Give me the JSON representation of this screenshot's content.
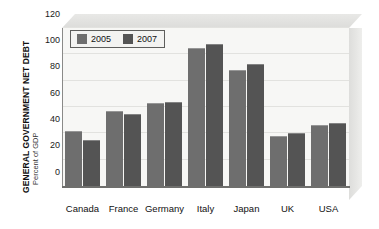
{
  "chart_data": {
    "type": "bar",
    "title": "GENERAL GOVERNMENT NET DEBT",
    "subtitle": "Percent of GDP",
    "xlabel": "",
    "ylabel": "Percent of GDP",
    "categories": [
      "Canada",
      "France",
      "Germany",
      "Italy",
      "Japan",
      "UK",
      "USA"
    ],
    "series": [
      {
        "name": "2005",
        "color": "#6e6e6e",
        "values": [
          42,
          57,
          63,
          105,
          88,
          38,
          46
        ]
      },
      {
        "name": "2007",
        "color": "#545454",
        "values": [
          35,
          55,
          64,
          108,
          93,
          40,
          48
        ]
      }
    ],
    "ylim": [
      0,
      120
    ],
    "yticks": [
      0,
      20,
      40,
      60,
      80,
      100,
      120
    ],
    "ytick_labels": [
      "0",
      "20",
      "40",
      "60",
      "80",
      "100",
      "120"
    ],
    "grid": true,
    "legend_position": "top-left",
    "legend_entries": [
      "2005",
      "2007"
    ],
    "style": "3d-block"
  },
  "axis": {
    "title_main": "GENERAL GOVERNMENT NET DEBT",
    "title_sub": "Percent of GDP"
  },
  "colors": {
    "series_2005": "#6e6e6e",
    "series_2007": "#545454",
    "plot_background": "#f7f7f5",
    "gridline": "#e2e2df",
    "axis_line": "#6f6f6d"
  }
}
